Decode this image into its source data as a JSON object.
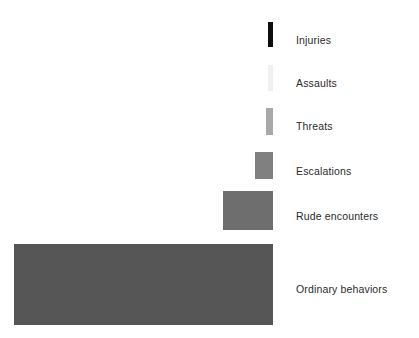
{
  "chart_data": {
    "type": "bar",
    "orientation": "horizontal",
    "title": "",
    "subtitle": "",
    "xlabel": "",
    "ylabel": "",
    "legend": "none",
    "grid": false,
    "axis_visible": false,
    "axis_ticks": [],
    "note": "Right-aligned horizontal bars (pyramid of escalating behaviors); bar width encodes relative frequency, widest at bottom.",
    "categories": [
      "Injuries",
      "Assaults",
      "Threats",
      "Escalations",
      "Rude encounters",
      "Ordinary behaviors"
    ],
    "values": [
      4,
      4,
      6,
      18,
      50,
      259
    ],
    "value_unit": "px bar width (relative frequency)",
    "bars": [
      {
        "label": "Injuries",
        "value": 4,
        "color": "#0d0d0d",
        "x": 268,
        "y": 22,
        "width": 5,
        "height": 25
      },
      {
        "label": "Assaults",
        "value": 4,
        "color": "#f0f0f0",
        "x": 268,
        "y": 65,
        "width": 5,
        "height": 26
      },
      {
        "label": "Threats",
        "value": 6,
        "color": "#a8a8a8",
        "x": 266,
        "y": 108,
        "width": 7,
        "height": 27
      },
      {
        "label": "Escalations",
        "value": 18,
        "color": "#808080",
        "x": 255,
        "y": 152,
        "width": 18,
        "height": 27
      },
      {
        "label": "Rude encounters",
        "value": 50,
        "color": "#6e6e6e",
        "x": 223,
        "y": 191,
        "width": 50,
        "height": 39
      },
      {
        "label": "Ordinary behaviors",
        "value": 259,
        "color": "#565656",
        "x": 14,
        "y": 244,
        "width": 259,
        "height": 81
      }
    ],
    "label_positions": [
      {
        "label": "Injuries",
        "y": 35
      },
      {
        "label": "Assaults",
        "y": 78
      },
      {
        "label": "Threats",
        "y": 121
      },
      {
        "label": "Escalations",
        "y": 166
      },
      {
        "label": "Rude encounters",
        "y": 211
      },
      {
        "label": "Ordinary behaviors",
        "y": 284
      }
    ],
    "colors": {
      "background": "#ffffff",
      "text": "#2b2b2b",
      "injuries": "#0d0d0d",
      "assaults": "#f0f0f0",
      "threats": "#a8a8a8",
      "escalations": "#808080",
      "rude_encounters": "#6e6e6e",
      "ordinary_behaviors": "#565656"
    }
  }
}
